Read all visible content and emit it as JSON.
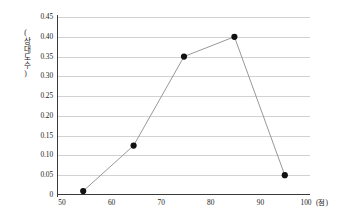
{
  "chart_data": {
    "type": "line",
    "title": "",
    "subtitle": "",
    "xlabel": "",
    "ylabel": "(상대도수)",
    "x_unit": "(점)",
    "x": [
      55,
      65,
      75,
      85,
      95
    ],
    "values": [
      0.01,
      0.125,
      0.35,
      0.4,
      0.05
    ],
    "series": [
      {
        "name": "상대도수",
        "x": [
          55,
          65,
          75,
          85,
          95
        ],
        "values": [
          0.01,
          0.125,
          0.35,
          0.4,
          0.05
        ]
      }
    ],
    "xlim": [
      50,
      100
    ],
    "ylim": [
      0,
      0.45
    ],
    "xticks": [
      50,
      60,
      70,
      80,
      90,
      100
    ],
    "xtick_labels": [
      "50",
      "60",
      "70",
      "80",
      "90",
      "100"
    ],
    "yticks": [
      0,
      0.05,
      0.1,
      0.15,
      0.2,
      0.25,
      0.3,
      0.35,
      0.4,
      0.45
    ],
    "ytick_labels": [
      "0",
      "0.05",
      "0.10",
      "0.15",
      "0.20",
      "0.25",
      "0.30",
      "0.35",
      "0.40",
      "0.45"
    ],
    "grid": "horizontal",
    "legend": "none",
    "marker": "filled-circle",
    "colors": {
      "line": "#8c8c8c",
      "marker": "#111111",
      "grid": "#d2d2d2",
      "axis": "#3a3a3a",
      "background": "#ffffff",
      "text": "#1d1d1d"
    }
  }
}
